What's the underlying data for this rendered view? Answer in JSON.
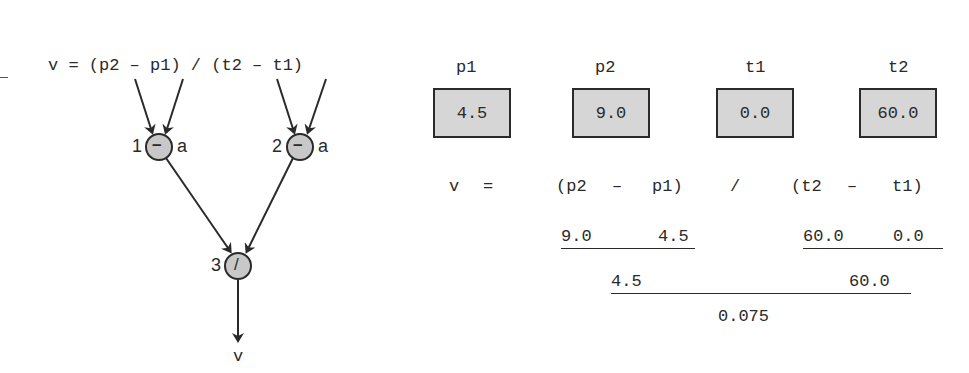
{
  "diagram": {
    "equation": "v = (p2 – p1) / (t2 – t1)",
    "nodes": [
      {
        "id": "1",
        "op": "–",
        "side_label": "a"
      },
      {
        "id": "2",
        "op": "–",
        "side_label": "a"
      },
      {
        "id": "3",
        "op": "/",
        "side_label": ""
      }
    ],
    "output_label": "v",
    "colors": {
      "node_fill": "#c8c8c8",
      "stroke": "#2a2a2a",
      "box_fill": "#d6d6d6"
    }
  },
  "variables": [
    {
      "name": "p1",
      "value": "4.5"
    },
    {
      "name": "p2",
      "value": "9.0"
    },
    {
      "name": "t1",
      "value": "0.0"
    },
    {
      "name": "t2",
      "value": "60.0"
    }
  ],
  "evaluation": {
    "row1": {
      "lhs": "v",
      "eq": "=",
      "open1": "(p2",
      "minus1": "–",
      "close1": "p1)",
      "div": "/",
      "open2": "(t2",
      "minus2": "–",
      "close2": "t1)"
    },
    "row2": {
      "a": "9.0",
      "b": "4.5",
      "c": "60.0",
      "d": "0.0"
    },
    "row3": {
      "numerator": "4.5",
      "denominator": "60.0"
    },
    "result": "0.075"
  }
}
